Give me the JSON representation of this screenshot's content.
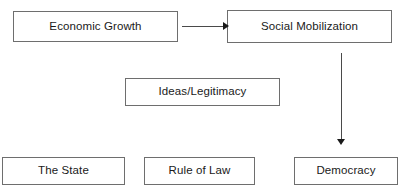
{
  "diagram": {
    "type": "flow-diagram",
    "background_color": "#ffffff",
    "box_border_color": "#6e6e6e",
    "text_color": "#1a1a1a",
    "arrow_color": "#1a1a1a",
    "nodes": [
      {
        "id": "economic-growth",
        "label": "Economic Growth",
        "x": 13,
        "y": 11,
        "width": 165,
        "height": 31
      },
      {
        "id": "social-mobilization",
        "label": "Social Mobilization",
        "x": 227,
        "y": 10,
        "width": 165,
        "height": 33
      },
      {
        "id": "ideas-legitimacy",
        "label": "Ideas/Legitimacy",
        "x": 125,
        "y": 78,
        "width": 155,
        "height": 28
      },
      {
        "id": "the-state",
        "label": "The State",
        "x": 2,
        "y": 157,
        "width": 123,
        "height": 28
      },
      {
        "id": "rule-of-law",
        "label": "Rule of Law",
        "x": 144,
        "y": 157,
        "width": 111,
        "height": 28
      },
      {
        "id": "democracy",
        "label": "Democracy",
        "x": 294,
        "y": 157,
        "width": 104,
        "height": 28
      }
    ],
    "edges": [
      {
        "id": "growth-to-mobilization",
        "from": "economic-growth",
        "to": "social-mobilization",
        "orientation": "horizontal",
        "x": 182,
        "y": 26,
        "length": 42
      },
      {
        "id": "mobilization-to-democracy",
        "from": "social-mobilization",
        "to": "democracy",
        "orientation": "vertical",
        "x": 341,
        "y": 53,
        "length": 87
      }
    ]
  }
}
